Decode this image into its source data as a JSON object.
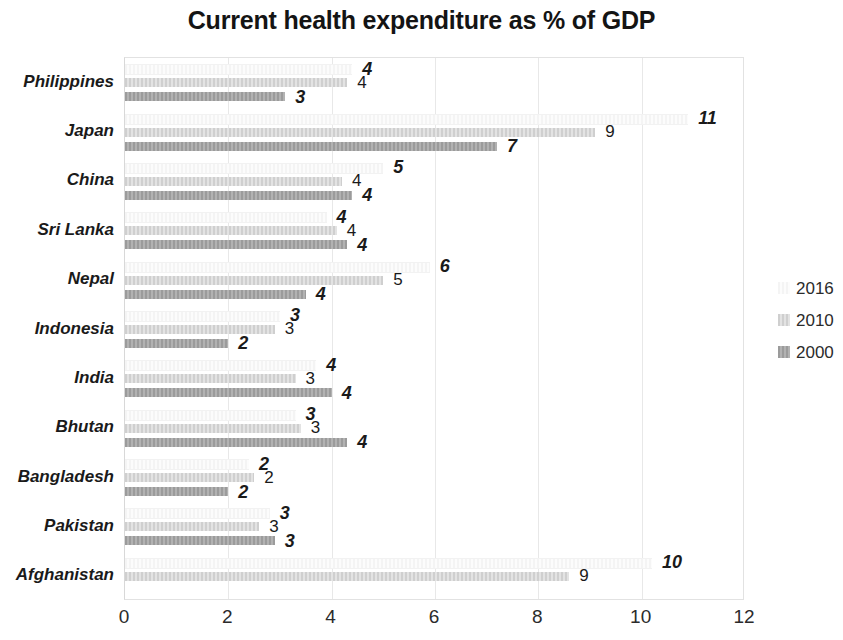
{
  "chart_data": {
    "type": "bar",
    "orientation": "horizontal",
    "title": "Current health expenditure as % of GDP",
    "xlabel": "",
    "ylabel": "",
    "xlim": [
      0,
      12
    ],
    "xticks": [
      0,
      2,
      4,
      6,
      8,
      10,
      12
    ],
    "grid": true,
    "legend_position": "right",
    "categories": [
      "Philippines",
      "Japan",
      "China",
      "Sri Lanka",
      "Nepal",
      "Indonesia",
      "India",
      "Bhutan",
      "Bangladesh",
      "Pakistan",
      "Afghanistan"
    ],
    "series": [
      {
        "name": "2016",
        "color": "#fbfbfb",
        "values": [
          4.4,
          10.9,
          5.0,
          3.9,
          5.9,
          3.0,
          3.7,
          3.3,
          2.4,
          2.8,
          10.2
        ],
        "labels": [
          "4",
          "11",
          "5",
          "4",
          "6",
          "3",
          "4",
          "3",
          "2",
          "3",
          "10"
        ]
      },
      {
        "name": "2010",
        "color": "#d9d9d9",
        "values": [
          4.3,
          9.1,
          4.2,
          4.1,
          5.0,
          2.9,
          3.3,
          3.4,
          2.5,
          2.6,
          8.6
        ],
        "labels": [
          "4",
          "9",
          "4",
          "4",
          "5",
          "3",
          "3",
          "3",
          "2",
          "3",
          "9"
        ]
      },
      {
        "name": "2000",
        "color": "#a6a6a6",
        "values": [
          3.1,
          7.2,
          4.4,
          4.3,
          3.5,
          2.0,
          4.0,
          4.3,
          2.0,
          2.9,
          null
        ],
        "labels": [
          "3",
          "7",
          "4",
          "4",
          "4",
          "2",
          "4",
          "4",
          "2",
          "3",
          ""
        ]
      }
    ]
  },
  "legend": {
    "items": [
      {
        "label": "2016",
        "swatch_class": "s2016"
      },
      {
        "label": "2010",
        "swatch_class": "s2010"
      },
      {
        "label": "2000",
        "swatch_class": "s2000"
      }
    ]
  }
}
